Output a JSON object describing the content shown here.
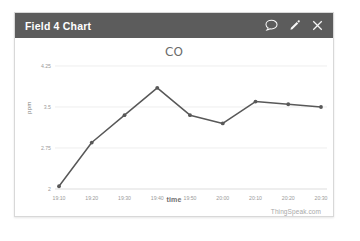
{
  "widget": {
    "title": "Field 4 Chart",
    "header_color": "#5c5c5c",
    "actions": [
      {
        "name": "comment-icon",
        "label": "Comment"
      },
      {
        "name": "edit-icon",
        "label": "Edit"
      },
      {
        "name": "close-icon",
        "label": "Close"
      }
    ]
  },
  "watermark": "ThingSpeak.com",
  "chart_data": {
    "type": "line",
    "title": "CO",
    "xlabel": "time",
    "ylabel": "ppm",
    "grid": true,
    "legend": false,
    "line_color": "#585858",
    "categories": [
      "19:10",
      "19:20",
      "19:30",
      "19:40",
      "19:50",
      "20:00",
      "20:10",
      "20:20",
      "20:30"
    ],
    "x": [
      "19:10",
      "19:20",
      "19:30",
      "19:40",
      "19:50",
      "20:00",
      "20:10",
      "20:20",
      "20:30"
    ],
    "values": [
      2.05,
      2.85,
      3.35,
      3.85,
      3.35,
      3.2,
      3.6,
      3.55,
      3.5
    ],
    "ytick_labels": [
      "4.25",
      "3.5",
      "2.75",
      "2"
    ],
    "ytick_values": [
      4.25,
      3.5,
      2.75,
      2
    ],
    "ylim": [
      2,
      4.25
    ],
    "series": [
      {
        "name": "CO",
        "values": [
          2.05,
          2.85,
          3.35,
          3.85,
          3.35,
          3.2,
          3.6,
          3.55,
          3.5
        ]
      }
    ]
  }
}
